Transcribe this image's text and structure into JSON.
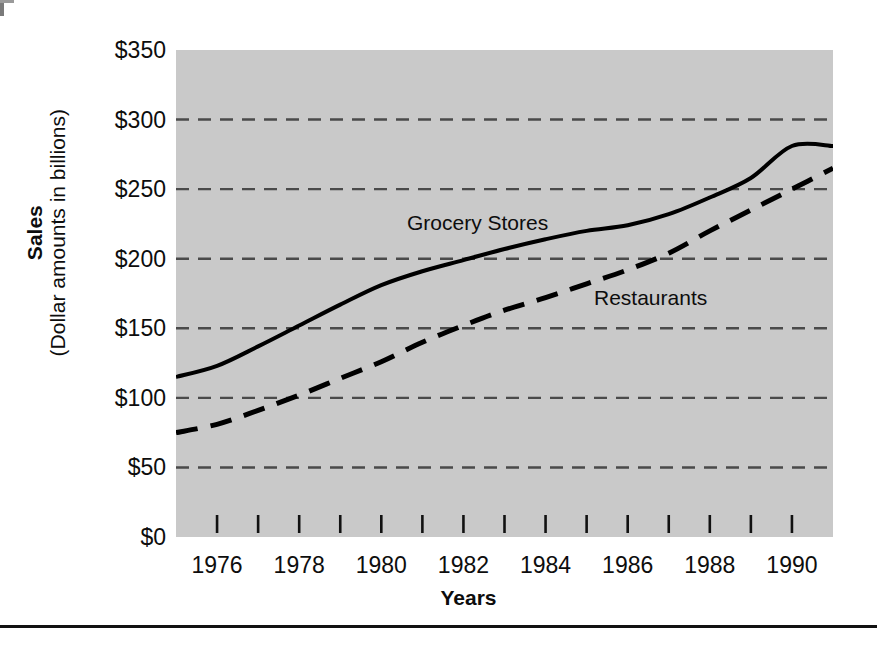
{
  "chart_data": {
    "type": "line",
    "title": "",
    "subtitle": "",
    "xlabel": "Years",
    "ylabel": "Sales",
    "ylabel_sub": "(Dollar amounts in billions)",
    "xlim": [
      1975,
      1991
    ],
    "ylim": [
      0,
      350
    ],
    "grid": "horizontal-dashed",
    "legend_position": "inline-annotations",
    "y_ticks": [
      0,
      50,
      100,
      150,
      200,
      250,
      300,
      350
    ],
    "y_tick_labels": [
      "$0",
      "$50",
      "$100",
      "$150",
      "$200",
      "$250",
      "$300",
      "$350"
    ],
    "x_ticks": [
      1976,
      1977,
      1978,
      1979,
      1980,
      1981,
      1982,
      1983,
      1984,
      1985,
      1986,
      1987,
      1988,
      1989,
      1990
    ],
    "x_tick_labels": [
      "1976",
      "",
      "1978",
      "",
      "1980",
      "",
      "1982",
      "",
      "1984",
      "",
      "1986",
      "",
      "1988",
      "",
      "1990"
    ],
    "x_labeled_ticks": [
      1976,
      1978,
      1980,
      1982,
      1984,
      1986,
      1988,
      1990
    ],
    "x": [
      1975,
      1976,
      1977,
      1978,
      1979,
      1980,
      1981,
      1982,
      1983,
      1984,
      1985,
      1986,
      1987,
      1988,
      1989,
      1990,
      1991
    ],
    "series": [
      {
        "name": "Grocery Stores",
        "style": "solid",
        "color": "#000000",
        "values": [
          115,
          123,
          137,
          152,
          167,
          181,
          191,
          199,
          207,
          214,
          220,
          224,
          232,
          244,
          258,
          281,
          281
        ]
      },
      {
        "name": "Restaurants",
        "style": "dashed",
        "color": "#000000",
        "values": [
          75,
          81,
          91,
          102,
          114,
          126,
          140,
          152,
          163,
          172,
          182,
          192,
          204,
          220,
          235,
          250,
          265
        ]
      }
    ],
    "annotations": [
      {
        "text": "Grocery Stores",
        "series": "Grocery Stores"
      },
      {
        "text": "Restaurants",
        "series": "Restaurants"
      }
    ],
    "colors": {
      "plot_background": "#c9c9c9",
      "page_background": "#ffffff",
      "line": "#000000",
      "gridline": "#4a4a4a",
      "text": "#0d0d0d"
    }
  }
}
